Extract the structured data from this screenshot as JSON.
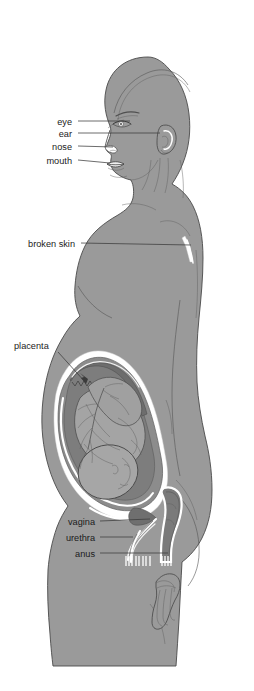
{
  "diagram": {
    "view": "left lateral profile, cropped at mid-thigh",
    "background_color": "#ffffff"
  },
  "colors": {
    "body_fill": "#9a9a9a",
    "body_outline": "#4a4a4a",
    "womb_wall": "#8a8a8a",
    "amniotic_fluid": "#7e7e7e",
    "fetus_fill": "#a3a3a3",
    "placenta_fill": "#6f6f6f",
    "white_membrane": "#ffffff",
    "label_text": "#1b1b1b",
    "leader_line": "#3b3b3b"
  },
  "labels": [
    {
      "id": "eye",
      "text": "eye",
      "align": "right",
      "x": 72,
      "y": 124,
      "leader_to_x": 130,
      "leader_to_y": 124
    },
    {
      "id": "ear",
      "text": "ear",
      "align": "right",
      "x": 72,
      "y": 136,
      "leader_to_x": 178,
      "leader_to_y": 135
    },
    {
      "id": "nose",
      "text": "nose",
      "align": "right",
      "x": 72,
      "y": 149,
      "leader_to_x": 116,
      "leader_to_y": 150
    },
    {
      "id": "mouth",
      "text": "mouth",
      "align": "right",
      "x": 72,
      "y": 163,
      "leader_to_x": 113,
      "leader_to_y": 167
    },
    {
      "id": "broken-skin",
      "text": "broken skin",
      "align": "right",
      "x": 75,
      "y": 246,
      "leader_to_x": 193,
      "leader_to_y": 248
    },
    {
      "id": "placenta",
      "text": "placenta",
      "align": "left",
      "x": 14,
      "y": 348,
      "leader_to_x": 86,
      "leader_to_y": 385
    },
    {
      "id": "vagina",
      "text": "vagina",
      "align": "right",
      "x": 95,
      "y": 524,
      "leader_to_x": 148,
      "leader_to_y": 522
    },
    {
      "id": "urethra",
      "text": "urethra",
      "align": "right",
      "x": 95,
      "y": 540,
      "leader_to_x": 131,
      "leader_to_y": 540
    },
    {
      "id": "anus",
      "text": "anus",
      "align": "right",
      "x": 95,
      "y": 556,
      "leader_to_x": 172,
      "leader_to_y": 555
    }
  ],
  "anatomy_parts": [
    {
      "id": "head",
      "name": "head"
    },
    {
      "id": "eye",
      "name": "eye"
    },
    {
      "id": "ear",
      "name": "ear"
    },
    {
      "id": "nose",
      "name": "nose"
    },
    {
      "id": "mouth",
      "name": "mouth"
    },
    {
      "id": "breast",
      "name": "breast"
    },
    {
      "id": "broken-skin",
      "name": "broken skin mark"
    },
    {
      "id": "womb",
      "name": "womb"
    },
    {
      "id": "placenta",
      "name": "placenta"
    },
    {
      "id": "fetus",
      "name": "fetus"
    },
    {
      "id": "umbilical-cord",
      "name": "umbilical cord"
    },
    {
      "id": "amniotic-sac",
      "name": "amniotic sac"
    },
    {
      "id": "vagina",
      "name": "vagina"
    },
    {
      "id": "urethra",
      "name": "urethra"
    },
    {
      "id": "anus",
      "name": "anus"
    },
    {
      "id": "rectum",
      "name": "rectum"
    },
    {
      "id": "hand",
      "name": "hand"
    },
    {
      "id": "thigh",
      "name": "thigh"
    }
  ]
}
